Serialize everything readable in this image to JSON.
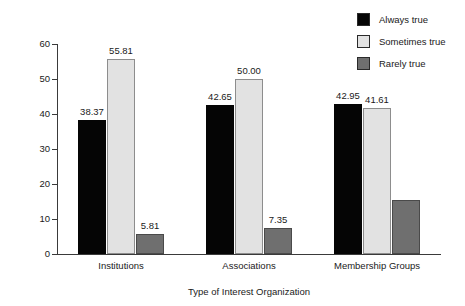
{
  "chart_data": {
    "type": "bar",
    "title": "",
    "xlabel": "Type of Interest Organization",
    "ylabel": "Percentage of Responses",
    "categories": [
      "Institutions",
      "Associations",
      "Membership Groups"
    ],
    "series": [
      {
        "name": "Always true",
        "color": "#050505",
        "values": [
          38.37,
          42.65,
          42.95
        ],
        "labels": [
          "38.37",
          "42.65",
          "42.95"
        ]
      },
      {
        "name": "Sometimes true",
        "color": "#e2e2e2",
        "values": [
          55.81,
          50.0,
          41.61
        ],
        "labels": [
          "55.81",
          "50.00",
          "41.61"
        ]
      },
      {
        "name": "Rarely true",
        "color": "#6f6f6f",
        "values": [
          5.81,
          7.35,
          15.4
        ],
        "labels": [
          "5.81",
          "7.35",
          ""
        ]
      }
    ],
    "ylim": [
      0,
      60
    ],
    "yticks": [
      0,
      10,
      20,
      30,
      40,
      50,
      60
    ],
    "ytick_labels": [
      "0",
      "10",
      "20",
      "30",
      "40",
      "50",
      "60"
    ],
    "grid": false,
    "legend_position": "top-right"
  },
  "legend": {
    "items": [
      {
        "label": "Always true",
        "color": "#050505"
      },
      {
        "label": "Sometimes true",
        "color": "#e2e2e2"
      },
      {
        "label": "Rarely true",
        "color": "#6f6f6f"
      }
    ]
  },
  "axes": {
    "y_title": "Percentage of Responses",
    "x_title": "Type of Interest Organization"
  }
}
